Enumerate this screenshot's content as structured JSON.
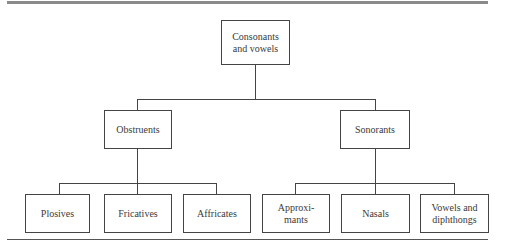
{
  "diagram": {
    "type": "tree",
    "root": {
      "label": "Consonants\nand vowels",
      "children": [
        {
          "label": "Obstruents",
          "children": [
            {
              "label": "Plosives"
            },
            {
              "label": "Fricatives"
            },
            {
              "label": "Affricates"
            }
          ]
        },
        {
          "label": "Sonorants",
          "children": [
            {
              "label": "Approxi-\nmants"
            },
            {
              "label": "Nasals"
            },
            {
              "label": "Vowels and\ndiphthongs"
            }
          ]
        }
      ]
    }
  },
  "colors": {
    "border": "#444444",
    "text": "#3a3a3a",
    "top_rule": "#8a8a8a"
  }
}
